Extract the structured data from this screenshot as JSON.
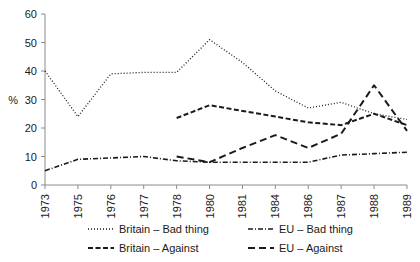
{
  "chart_data": {
    "type": "line",
    "title": "",
    "subtitle": "",
    "xlabel": "",
    "ylabel": "%",
    "ylim": [
      0,
      60
    ],
    "yticks": [
      0,
      10,
      20,
      30,
      40,
      50,
      60
    ],
    "grid": false,
    "legend_position": "bottom",
    "categories": [
      "1973",
      "1975",
      "1976",
      "1977",
      "1978",
      "1980",
      "1981",
      "1984",
      "1986",
      "1987",
      "1988",
      "1989"
    ],
    "series": [
      {
        "name": "Britain – Bad thing",
        "style": "dotted",
        "values": [
          40,
          24,
          39,
          39.5,
          39.5,
          51,
          43,
          33,
          27,
          29,
          25,
          23
        ]
      },
      {
        "name": "Britain – Against",
        "style": "dashed",
        "values": [
          null,
          null,
          null,
          null,
          23.5,
          28,
          26,
          24,
          22,
          21,
          25,
          21
        ]
      },
      {
        "name": "EU – Bad thing",
        "style": "dash-dot",
        "values": [
          5,
          9,
          9.5,
          10,
          8.5,
          8,
          8,
          8,
          8,
          10.5,
          11,
          11.5
        ]
      },
      {
        "name": "EU – Against",
        "style": "long-dash",
        "values": [
          null,
          null,
          null,
          null,
          10,
          8,
          13,
          17.5,
          13,
          18,
          35,
          19
        ]
      }
    ]
  },
  "axis": {
    "y_label": "%",
    "y_tick_labels": [
      "0",
      "10",
      "20",
      "30",
      "40",
      "50",
      "60"
    ],
    "x_tick_labels": [
      "1973",
      "1975",
      "1976",
      "1977",
      "1978",
      "1980",
      "1981",
      "1984",
      "1986",
      "1987",
      "1988",
      "1989"
    ]
  },
  "legend": {
    "entries": [
      {
        "label": "Britain – Bad thing",
        "style": "dotted"
      },
      {
        "label": "EU – Bad thing",
        "style": "dash-dot"
      },
      {
        "label": "Britain – Against",
        "style": "dashed"
      },
      {
        "label": "EU – Against",
        "style": "long-dash"
      }
    ]
  },
  "colors": {
    "line": "#1a1a1a",
    "axis": "#8a8a8a",
    "text": "#1a1a1a",
    "background": "#ffffff"
  }
}
